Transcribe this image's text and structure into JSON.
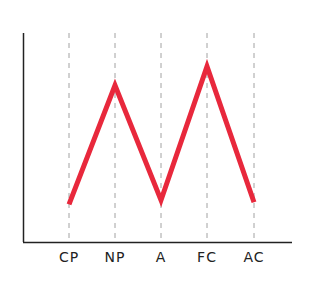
{
  "chart_data": {
    "type": "line",
    "title": "",
    "xlabel": "",
    "ylabel": "",
    "categories": [
      "CP",
      "NP",
      "A",
      "FC",
      "AC"
    ],
    "series": [
      {
        "name": "",
        "values": [
          1.8,
          7.5,
          2.0,
          8.4,
          1.9
        ],
        "color": "#e8283c"
      }
    ],
    "ylim": [
      0,
      10
    ],
    "y_ticks_shown": false,
    "grid": {
      "vertical_dashed_at_categories": true,
      "horizontal": false
    },
    "legend": null
  },
  "style": {
    "line_color": "#e8283c",
    "axis_color": "#222222",
    "grid_color": "#8a8a8a"
  }
}
